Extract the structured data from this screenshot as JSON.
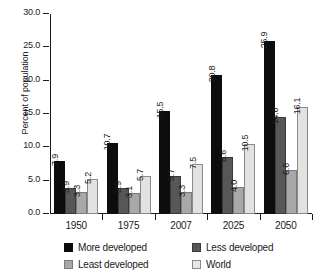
{
  "chart_data": {
    "type": "bar",
    "title": "",
    "xlabel": "",
    "ylabel": "Percent of population",
    "ylim": [
      0.0,
      30.0
    ],
    "ytick_step": 5.0,
    "ytick_labels": [
      "0.0",
      "5.0",
      "10.0",
      "15.0",
      "20.0",
      "25.0",
      "30.0"
    ],
    "ytick_values": [
      0.0,
      5.0,
      10.0,
      15.0,
      20.0,
      25.0,
      30.0
    ],
    "grid": false,
    "legend_position": "bottom",
    "categories": [
      "1950",
      "1975",
      "2007",
      "2025",
      "2050"
    ],
    "series": [
      {
        "name": "More developed",
        "color": "#0d0d0d",
        "values": [
          7.9,
          10.7,
          15.5,
          20.8,
          25.9
        ],
        "labels": [
          "7.9",
          "10.7",
          "15.5",
          "20.8",
          "25.9"
        ]
      },
      {
        "name": "Less developed",
        "color": "#575757",
        "values": [
          3.9,
          3.9,
          5.7,
          8.6,
          14.6
        ],
        "labels": [
          "3.9",
          "3.9",
          "5.7",
          "8.6",
          "14.6"
        ]
      },
      {
        "name": "Least developed",
        "color": "#a8a8a8",
        "values": [
          3.3,
          3.1,
          3.3,
          4.0,
          6.6
        ],
        "labels": [
          "3.3",
          "3.1",
          "3.3",
          "4.0",
          "6.6"
        ]
      },
      {
        "name": "World",
        "color": "#e2e2e2",
        "values": [
          5.2,
          5.7,
          7.5,
          10.5,
          16.1
        ],
        "labels": [
          "5.2",
          "5.7",
          "7.5",
          "10.5",
          "16.1"
        ]
      }
    ]
  },
  "legend": {
    "entries": [
      {
        "label": "More developed"
      },
      {
        "label": "Less developed"
      },
      {
        "label": "Least developed"
      },
      {
        "label": "World"
      }
    ]
  }
}
